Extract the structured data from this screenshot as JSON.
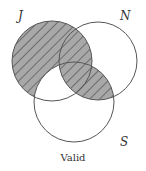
{
  "diagram": {
    "type": "venn",
    "sets": [
      {
        "label": "J",
        "cx": 52,
        "cy": 61,
        "r": 40
      },
      {
        "label": "N",
        "cx": 98,
        "cy": 61,
        "r": 39
      },
      {
        "label": "S",
        "cx": 74,
        "cy": 102,
        "r": 40
      }
    ],
    "shaded_regions": [
      "J not S",
      "N and S"
    ],
    "shade_color": "#a8a8a8",
    "hatch_color": "#3a3a3a",
    "stroke_color": "#555555",
    "caption": "Valid"
  },
  "labels": {
    "j": "J",
    "n": "N",
    "s": "S",
    "caption": "Valid"
  }
}
